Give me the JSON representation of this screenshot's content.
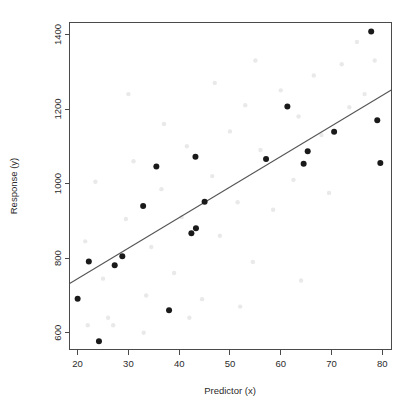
{
  "chart_data": {
    "type": "scatter",
    "title": "",
    "subtitle": "",
    "xlabel": "Predictor (x)",
    "ylabel": "Response (y)",
    "xlim": [
      18.4,
      81.8
    ],
    "ylim": [
      555,
      1432
    ],
    "xticks": [
      20,
      30,
      40,
      50,
      60,
      70,
      80
    ],
    "xtick_labels": [
      "20",
      "30",
      "40",
      "50",
      "60",
      "70",
      "80"
    ],
    "yticks": [
      600,
      800,
      1000,
      1200,
      1400
    ],
    "ytick_labels": [
      "600",
      "800",
      "1000",
      "1200",
      "1400"
    ],
    "grid": false,
    "legend": null,
    "point_color": "#1a1a1a",
    "line_color": "#555555",
    "axis_color": "#4a4a4a",
    "points": [
      {
        "x": 20.0,
        "y": 691
      },
      {
        "x": 22.2,
        "y": 791
      },
      {
        "x": 24.2,
        "y": 577
      },
      {
        "x": 27.3,
        "y": 781
      },
      {
        "x": 28.8,
        "y": 805
      },
      {
        "x": 32.9,
        "y": 940
      },
      {
        "x": 35.5,
        "y": 1046
      },
      {
        "x": 38.0,
        "y": 660
      },
      {
        "x": 42.4,
        "y": 867
      },
      {
        "x": 43.2,
        "y": 1072
      },
      {
        "x": 43.3,
        "y": 880
      },
      {
        "x": 45.0,
        "y": 951
      },
      {
        "x": 57.1,
        "y": 1066
      },
      {
        "x": 61.3,
        "y": 1207
      },
      {
        "x": 64.5,
        "y": 1053
      },
      {
        "x": 65.3,
        "y": 1087
      },
      {
        "x": 70.5,
        "y": 1139
      },
      {
        "x": 77.8,
        "y": 1408
      },
      {
        "x": 79.0,
        "y": 1170
      },
      {
        "x": 79.6,
        "y": 1055
      }
    ],
    "fit_line": {
      "x1": 18.43,
      "y1": 732,
      "x2": 81.76,
      "y2": 1251,
      "slope": 8.2,
      "intercept": 581
    },
    "faint_points": [
      {
        "x": 21.5,
        "y": 845
      },
      {
        "x": 23.5,
        "y": 1005
      },
      {
        "x": 25.0,
        "y": 745
      },
      {
        "x": 26.0,
        "y": 640
      },
      {
        "x": 29.5,
        "y": 905
      },
      {
        "x": 31.0,
        "y": 1060
      },
      {
        "x": 33.5,
        "y": 700
      },
      {
        "x": 34.5,
        "y": 830
      },
      {
        "x": 36.5,
        "y": 985
      },
      {
        "x": 39.0,
        "y": 760
      },
      {
        "x": 40.5,
        "y": 910
      },
      {
        "x": 41.5,
        "y": 1100
      },
      {
        "x": 44.5,
        "y": 690
      },
      {
        "x": 46.5,
        "y": 1020
      },
      {
        "x": 48.0,
        "y": 860
      },
      {
        "x": 50.0,
        "y": 1140
      },
      {
        "x": 51.5,
        "y": 950
      },
      {
        "x": 53.0,
        "y": 1210
      },
      {
        "x": 54.5,
        "y": 790
      },
      {
        "x": 56.0,
        "y": 1090
      },
      {
        "x": 58.5,
        "y": 930
      },
      {
        "x": 60.0,
        "y": 1250
      },
      {
        "x": 62.5,
        "y": 1010
      },
      {
        "x": 63.5,
        "y": 1180
      },
      {
        "x": 66.5,
        "y": 1290
      },
      {
        "x": 68.0,
        "y": 1130
      },
      {
        "x": 69.5,
        "y": 975
      },
      {
        "x": 72.0,
        "y": 1320
      },
      {
        "x": 73.5,
        "y": 1205
      },
      {
        "x": 75.0,
        "y": 1380
      },
      {
        "x": 76.5,
        "y": 1240
      },
      {
        "x": 78.5,
        "y": 1330
      },
      {
        "x": 30.0,
        "y": 1240
      },
      {
        "x": 47.0,
        "y": 1270
      },
      {
        "x": 55.0,
        "y": 1330
      },
      {
        "x": 37.0,
        "y": 1160
      },
      {
        "x": 22.0,
        "y": 620
      },
      {
        "x": 27.0,
        "y": 620
      },
      {
        "x": 33.0,
        "y": 600
      },
      {
        "x": 42.0,
        "y": 640
      },
      {
        "x": 52.0,
        "y": 670
      },
      {
        "x": 64.0,
        "y": 740
      }
    ]
  }
}
